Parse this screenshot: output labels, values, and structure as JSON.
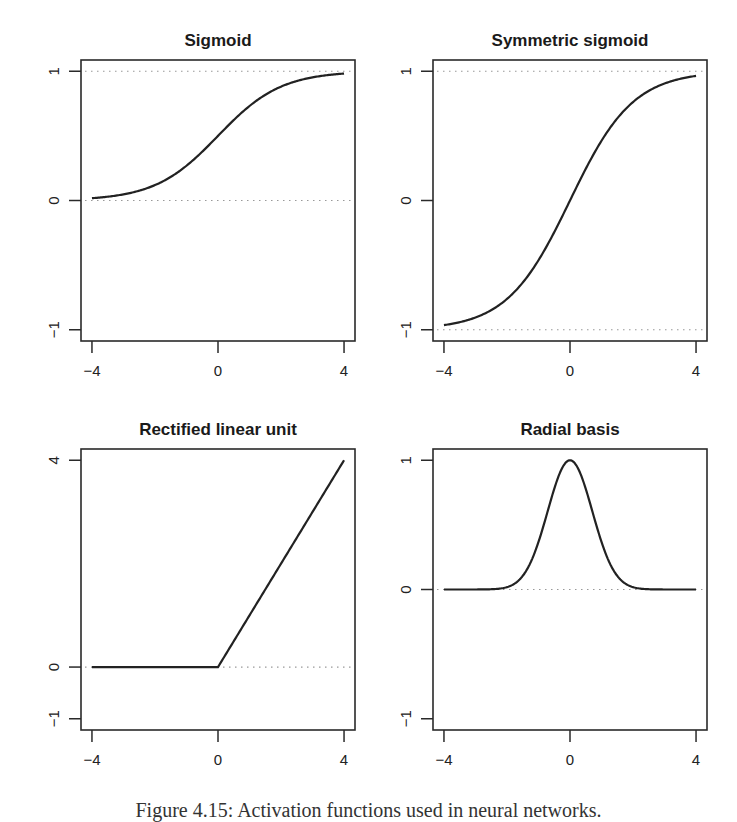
{
  "caption": "Figure 4.15: Activation functions used in neural networks.",
  "chart_data": [
    {
      "type": "line",
      "title": "Sigmoid",
      "function": "1/(1+exp(-x))",
      "x": [
        -4,
        -3,
        -2,
        -1,
        0,
        1,
        2,
        3,
        4
      ],
      "y": [
        0.018,
        0.047,
        0.119,
        0.269,
        0.5,
        0.731,
        0.881,
        0.953,
        0.982
      ],
      "xlim": [
        -4,
        4
      ],
      "ylim": [
        -1,
        1
      ],
      "xticks": [
        "-4",
        "0",
        "4"
      ],
      "yticks": [
        "-1",
        "0",
        "1"
      ],
      "xtick_values": [
        -4,
        0,
        4
      ],
      "ytick_values": [
        -1,
        0,
        1
      ],
      "reference_lines": [
        0,
        1
      ],
      "xlabel": "",
      "ylabel": "",
      "grid": false
    },
    {
      "type": "line",
      "title": "Symmetric sigmoid",
      "function": "tanh(x/2)",
      "x": [
        -4,
        -3,
        -2,
        -1,
        0,
        1,
        2,
        3,
        4
      ],
      "y": [
        -0.964,
        -0.905,
        -0.762,
        -0.462,
        0,
        0.462,
        0.762,
        0.905,
        0.964
      ],
      "xlim": [
        -4,
        4
      ],
      "ylim": [
        -1,
        1
      ],
      "xticks": [
        "-4",
        "0",
        "4"
      ],
      "yticks": [
        "-1",
        "0",
        "1"
      ],
      "xtick_values": [
        -4,
        0,
        4
      ],
      "ytick_values": [
        -1,
        0,
        1
      ],
      "reference_lines": [
        -1,
        1
      ],
      "xlabel": "",
      "ylabel": "",
      "grid": false
    },
    {
      "type": "line",
      "title": "Rectified linear unit",
      "function": "max(0,x)",
      "x": [
        -4,
        -2,
        0,
        2,
        4
      ],
      "y": [
        0,
        0,
        0,
        2,
        4
      ],
      "xlim": [
        -4,
        4
      ],
      "ylim": [
        -1,
        4
      ],
      "xticks": [
        "-4",
        "0",
        "4"
      ],
      "yticks": [
        "-1",
        "0",
        "4"
      ],
      "xtick_values": [
        -4,
        0,
        4
      ],
      "ytick_values": [
        -1,
        0,
        4
      ],
      "reference_lines": [
        0
      ],
      "xlabel": "",
      "ylabel": "",
      "grid": false
    },
    {
      "type": "line",
      "title": "Radial basis",
      "function": "exp(-x^2)",
      "x": [
        -4,
        -3,
        -2,
        -1.5,
        -1,
        -0.5,
        0,
        0.5,
        1,
        1.5,
        2,
        3,
        4
      ],
      "y": [
        0,
        0,
        0.018,
        0.105,
        0.368,
        0.779,
        1,
        0.779,
        0.368,
        0.105,
        0.018,
        0,
        0
      ],
      "xlim": [
        -4,
        4
      ],
      "ylim": [
        -1,
        1
      ],
      "xticks": [
        "-4",
        "0",
        "4"
      ],
      "yticks": [
        "-1",
        "0",
        "1"
      ],
      "xtick_values": [
        -4,
        0,
        4
      ],
      "ytick_values": [
        -1,
        0,
        1
      ],
      "reference_lines": [
        0
      ],
      "xlabel": "",
      "ylabel": "",
      "grid": false
    }
  ]
}
